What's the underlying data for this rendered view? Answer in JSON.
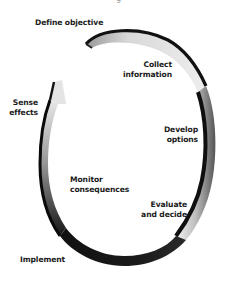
{
  "diagram": {
    "type": "cycle-ribbon",
    "direction": "clockwise",
    "top_fragment": "g",
    "steps": [
      {
        "id": "define-objective",
        "lines": [
          "Define objective"
        ]
      },
      {
        "id": "collect-information",
        "lines": [
          "Collect",
          "information"
        ]
      },
      {
        "id": "develop-options",
        "lines": [
          "Develop",
          "options"
        ]
      },
      {
        "id": "evaluate-and-decide",
        "lines": [
          "Evaluate",
          "and decide"
        ]
      },
      {
        "id": "implement",
        "lines": [
          "Implement"
        ]
      },
      {
        "id": "monitor-consequences",
        "lines": [
          "Monitor",
          "consequences"
        ]
      },
      {
        "id": "sense-effects",
        "lines": [
          "Sense",
          "effects"
        ]
      }
    ],
    "colors": {
      "ribbon_dark": "#111111",
      "ribbon_light": "#e6e6e6",
      "text": "#1a1a1a",
      "background": "#ffffff"
    }
  }
}
